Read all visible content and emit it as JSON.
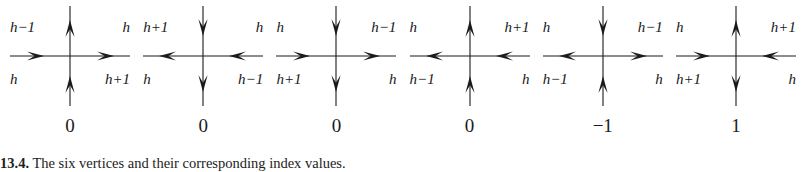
{
  "figure": {
    "caption_number": "13.4.",
    "caption_text": "The six vertices and their corresponding index values.",
    "stroke_color": "#1b1b1b",
    "background_color": "#ffffff"
  },
  "vertices": [
    {
      "name": "vertex-1",
      "labels": {
        "top_left": "h−1",
        "top_right": "h",
        "bottom_left": "h",
        "bottom_right": "h+1"
      },
      "arrows": {
        "up": "up",
        "down": "up",
        "left": "right",
        "right": "right"
      },
      "index": "0"
    },
    {
      "name": "vertex-2",
      "labels": {
        "top_left": "h+1",
        "top_right": "h",
        "bottom_left": "h",
        "bottom_right": "h−1"
      },
      "arrows": {
        "up": "down",
        "down": "down",
        "left": "left",
        "right": "left"
      },
      "index": "0"
    },
    {
      "name": "vertex-3",
      "labels": {
        "top_left": "h",
        "top_right": "h−1",
        "bottom_left": "h+1",
        "bottom_right": "h"
      },
      "arrows": {
        "up": "down",
        "down": "down",
        "left": "right",
        "right": "right"
      },
      "index": "0"
    },
    {
      "name": "vertex-4",
      "labels": {
        "top_left": "h",
        "top_right": "h+1",
        "bottom_left": "h−1",
        "bottom_right": "h"
      },
      "arrows": {
        "up": "up",
        "down": "up",
        "left": "left",
        "right": "left"
      },
      "index": "0"
    },
    {
      "name": "vertex-5",
      "labels": {
        "top_left": "h",
        "top_right": "h−1",
        "bottom_left": "h−1",
        "bottom_right": "h"
      },
      "arrows": {
        "up": "down",
        "down": "up",
        "left": "left",
        "right": "right"
      },
      "index": "−1"
    },
    {
      "name": "vertex-6",
      "labels": {
        "top_left": "h",
        "top_right": "h+1",
        "bottom_left": "h+1",
        "bottom_right": "h"
      },
      "arrows": {
        "up": "up",
        "down": "down",
        "left": "right",
        "right": "left"
      },
      "index": "1"
    }
  ]
}
